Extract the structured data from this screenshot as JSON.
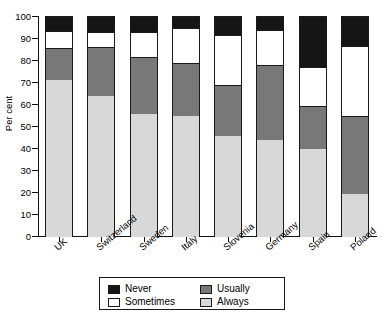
{
  "chart_data": {
    "type": "bar",
    "subtype": "stacked-bar-100-percent",
    "title": "",
    "xlabel": "",
    "ylabel": "Per cent",
    "ylim": [
      0,
      100
    ],
    "yticks": [
      0,
      10,
      20,
      30,
      40,
      50,
      60,
      70,
      80,
      90,
      100
    ],
    "grid": false,
    "legend_position": "bottom",
    "categories": [
      "UK",
      "Switzerland",
      "Sweden",
      "Italy",
      "Slovenia",
      "Germany",
      "Spain",
      "Poland"
    ],
    "series": [
      {
        "name": "Always",
        "color": "#d8d8d8",
        "values": [
          71.5,
          64.0,
          56.0,
          55.0,
          46.0,
          44.0,
          40.0,
          19.5
        ]
      },
      {
        "name": "Usually",
        "color": "#787878",
        "values": [
          14.5,
          22.5,
          26.0,
          24.0,
          23.0,
          34.0,
          19.5,
          35.5
        ]
      },
      {
        "name": "Sometimes",
        "color": "#ffffff",
        "values": [
          7.5,
          6.5,
          11.0,
          16.0,
          23.0,
          16.0,
          18.0,
          32.0
        ]
      },
      {
        "name": "Never",
        "color": "#151515",
        "values": [
          6.5,
          7.0,
          7.0,
          5.0,
          8.0,
          6.0,
          22.5,
          13.0
        ]
      }
    ],
    "cumulative_tops": {
      "UK": {
        "always": 71.5,
        "usually": 86.0,
        "sometimes": 93.5,
        "never": 100
      },
      "Switzerland": {
        "always": 64.0,
        "usually": 86.5,
        "sometimes": 93.0,
        "never": 100
      },
      "Sweden": {
        "always": 56.0,
        "usually": 82.0,
        "sometimes": 93.0,
        "never": 100
      },
      "Italy": {
        "always": 55.0,
        "usually": 79.0,
        "sometimes": 95.0,
        "never": 100
      },
      "Slovenia": {
        "always": 46.0,
        "usually": 69.0,
        "sometimes": 92.0,
        "never": 100
      },
      "Germany": {
        "always": 44.0,
        "usually": 78.0,
        "sometimes": 94.0,
        "never": 100
      },
      "Spain": {
        "always": 40.0,
        "usually": 59.5,
        "sometimes": 77.5,
        "never": 100
      },
      "Poland": {
        "always": 19.5,
        "usually": 55.0,
        "sometimes": 87.0,
        "never": 100
      }
    }
  },
  "axis": {
    "y_title": "Per cent",
    "y_tick_labels": [
      "0",
      "10",
      "20",
      "30",
      "40",
      "50",
      "60",
      "70",
      "80",
      "90",
      "100"
    ],
    "x_tick_labels": [
      "UK",
      "Switzerland",
      "Sweden",
      "Italy",
      "Slovenia",
      "Germany",
      "Spain",
      "Poland"
    ]
  },
  "legend": {
    "items": [
      {
        "label": "Never",
        "color": "#151515"
      },
      {
        "label": "Sometimes",
        "color": "#ffffff"
      },
      {
        "label": "Usually",
        "color": "#787878"
      },
      {
        "label": "Always",
        "color": "#d8d8d8"
      }
    ]
  },
  "colors": {
    "never": "#151515",
    "sometimes": "#ffffff",
    "usually": "#787878",
    "always": "#d8d8d8",
    "axis": "#111111",
    "background": "#ffffff"
  }
}
